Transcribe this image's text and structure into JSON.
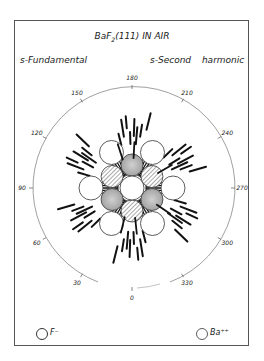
{
  "figure": {
    "title": "BaF2(111) IN AIR",
    "title_base": "BaF",
    "title_sub": "2",
    "title_rest": "(111) IN AIR",
    "label_left": "s-Fundamental",
    "label_right": "s-Second harmonic",
    "angle_ticks": [
      "0",
      "30",
      "60",
      "90",
      "120",
      "150",
      "180",
      "210",
      "240",
      "270",
      "300",
      "330"
    ],
    "legend": [
      {
        "symbol": "circle",
        "label": "F⁻"
      },
      {
        "symbol": "circle",
        "label": "Ba⁺⁺"
      }
    ]
  },
  "chart_data": {
    "type": "polar-diagram",
    "title": "BaF2(111) IN AIR",
    "subtitle_left": "s-Fundamental",
    "subtitle_right": "s-Second harmonic",
    "angular_axis": {
      "unit": "degrees",
      "ticks": [
        0,
        30,
        60,
        90,
        120,
        150,
        180,
        210,
        240,
        270,
        300,
        330
      ],
      "zero_position": "bottom",
      "direction": "counterclockwise (90 at left, 270 at right)"
    },
    "lattice": {
      "center_atom": "white circle",
      "inner_ring": 6,
      "outer_ring": 6,
      "symmetry": "6-fold"
    },
    "radial_marks": "short bold line segments clustered at 6 directions (0, 60, 120, 180, 240, 300 deg) indicating second-harmonic intensity",
    "legend": [
      "F-",
      "Ba++"
    ]
  }
}
